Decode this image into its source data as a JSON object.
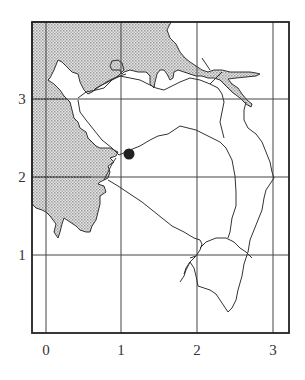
{
  "map": {
    "x_axis": {
      "ticks": [
        0,
        1,
        2,
        3
      ],
      "labels": [
        "0",
        "1",
        "2",
        "3"
      ]
    },
    "y_axis": {
      "ticks": [
        1,
        2,
        3
      ],
      "labels": [
        "1",
        "2",
        "3"
      ]
    },
    "marker": {
      "label": "point",
      "x": 1.1,
      "y": 2.3
    },
    "colors": {
      "land_shade": "#c8c8c8",
      "line": "#333333",
      "grid": "#444444",
      "background": "#ffffff"
    }
  }
}
